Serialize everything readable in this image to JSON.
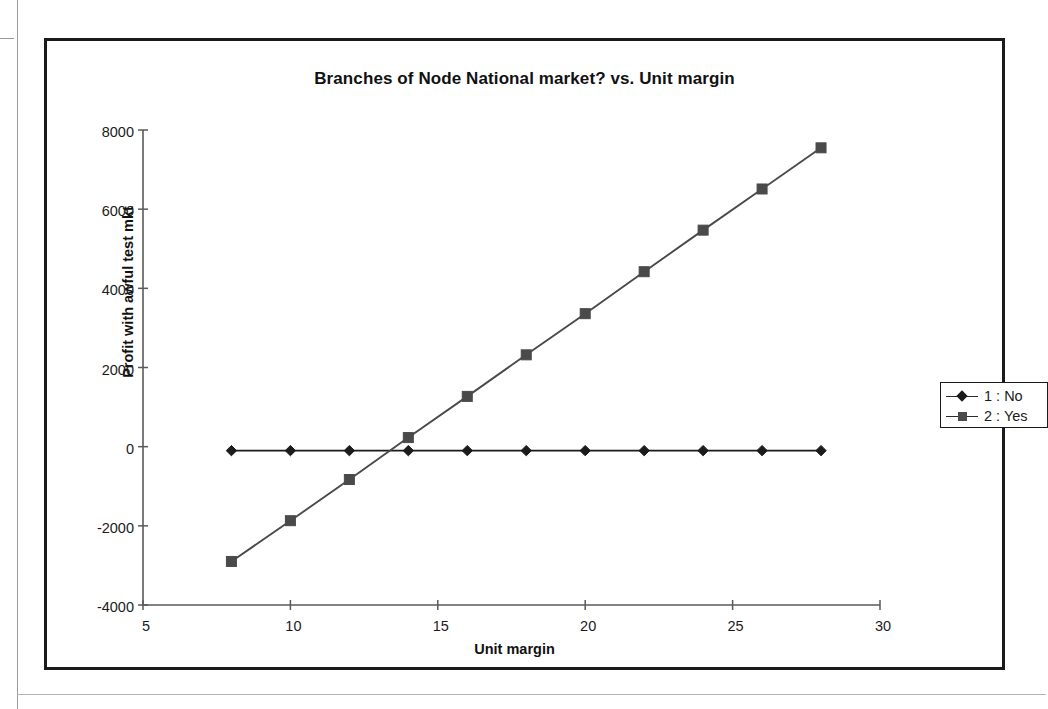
{
  "chart_data": {
    "type": "line",
    "title": "Branches of Node National market? vs. Unit margin",
    "xlabel": "Unit margin",
    "ylabel": "Profit with awful test mkt",
    "xlim": [
      5,
      30
    ],
    "ylim": [
      -4000,
      8000
    ],
    "xticks": [
      "5",
      "10",
      "15",
      "20",
      "25",
      "30"
    ],
    "yticks": [
      "8000",
      "6000",
      "4000",
      "2000",
      "0",
      "-2000",
      "-4000"
    ],
    "grid": false,
    "legend_position": "right",
    "x": [
      8,
      10,
      12,
      14,
      16,
      18,
      20,
      22,
      24,
      26,
      28
    ],
    "series": [
      {
        "name": "1 : No",
        "marker": "diamond",
        "color": "#1b1b1b",
        "values": [
          -100,
          -100,
          -100,
          -100,
          -100,
          -100,
          -100,
          -100,
          -100,
          -100,
          -100
        ]
      },
      {
        "name": "2 : Yes",
        "marker": "square",
        "color": "#4a4a4a",
        "values": [
          -2900,
          -1870,
          -830,
          230,
          1270,
          2320,
          3360,
          4420,
          5470,
          6510,
          7550
        ]
      }
    ]
  },
  "legend": {
    "items": [
      {
        "label": "1 : No"
      },
      {
        "label": "2 : Yes"
      }
    ]
  }
}
